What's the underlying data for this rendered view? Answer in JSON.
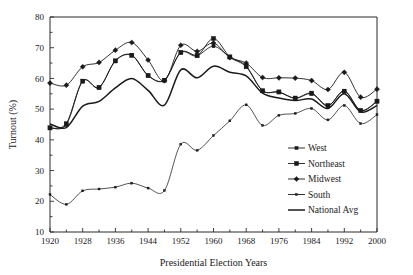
{
  "chart_data": {
    "type": "line",
    "title": "",
    "xlabel": "Presidential Election Years",
    "ylabel": "Turnout (%)",
    "xlim": [
      1920,
      2000
    ],
    "ylim": [
      10,
      80
    ],
    "grid": false,
    "legend_position": "inside-right",
    "x_ticks": [
      1920,
      1928,
      1936,
      1944,
      1952,
      1960,
      1968,
      1976,
      1984,
      1992,
      2000
    ],
    "x_minor_ticks": [
      1924,
      1932,
      1940,
      1948,
      1956,
      1964,
      1972,
      1980,
      1988,
      1996
    ],
    "y_ticks": [
      10,
      20,
      30,
      40,
      50,
      60,
      70,
      80
    ],
    "x": [
      1920,
      1924,
      1928,
      1932,
      1936,
      1940,
      1944,
      1948,
      1952,
      1956,
      1960,
      1964,
      1968,
      1972,
      1976,
      1980,
      1984,
      1988,
      1992,
      1996,
      2000
    ],
    "series": [
      {
        "name": "West",
        "marker": "plus",
        "values": [
          43.8,
          45.4,
          59.2,
          57.1,
          65.8,
          67.6,
          61.0,
          59.5,
          68.5,
          67.5,
          70.5,
          67.0,
          64.0,
          56.0,
          55.5,
          53.5,
          55.0,
          51.0,
          56.0,
          49.5,
          52.5
        ]
      },
      {
        "name": "Northeast",
        "marker": "square",
        "values": [
          43.9,
          45.0,
          59.1,
          57.0,
          65.7,
          67.5,
          60.9,
          59.4,
          68.4,
          67.4,
          73.0,
          67.0,
          63.8,
          56.0,
          55.6,
          53.6,
          55.2,
          51.2,
          55.8,
          49.6,
          52.6
        ]
      },
      {
        "name": "Midwest",
        "marker": "diamond",
        "values": [
          58.5,
          57.8,
          63.8,
          65.2,
          69.2,
          71.7,
          66.0,
          59.3,
          70.8,
          68.8,
          71.5,
          66.8,
          65.0,
          60.3,
          60.2,
          60.1,
          59.3,
          56.4,
          62.0,
          53.9,
          56.5
        ]
      },
      {
        "name": "South",
        "marker": "dot",
        "values": [
          22.2,
          19.0,
          23.4,
          24.0,
          24.6,
          25.9,
          24.3,
          23.5,
          38.6,
          36.6,
          41.4,
          46.2,
          51.4,
          44.7,
          48.0,
          48.6,
          50.2,
          46.5,
          51.2,
          45.3,
          48.2
        ]
      },
      {
        "name": "National Avg",
        "marker": "none",
        "values": [
          45.2,
          44.0,
          51.0,
          52.5,
          56.9,
          60.0,
          56.1,
          51.3,
          62.8,
          60.2,
          64.0,
          62.0,
          60.8,
          55.2,
          53.6,
          52.8,
          53.3,
          50.2,
          55.0,
          49.1,
          51.2
        ]
      }
    ],
    "note_series_51_line": {
      "name": "Flat-start series",
      "description": "Second flat line beginning at 51 in 1920"
    }
  },
  "legend": {
    "entries": [
      {
        "label": "West",
        "marker": "plus"
      },
      {
        "label": "Northeast",
        "marker": "square"
      },
      {
        "label": "Midwest",
        "marker": "diamond"
      },
      {
        "label": "South",
        "marker": "dot"
      },
      {
        "label": "National Avg",
        "marker": "none"
      }
    ]
  },
  "colors": {
    "line": "#1a1a1a",
    "axis": "#2b2b2b",
    "background": "#ffffff"
  }
}
